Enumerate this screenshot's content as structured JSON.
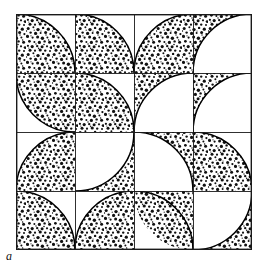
{
  "figure": {
    "label": "a",
    "caption_text": "a",
    "type": "truchet-quarter-circle-tiling",
    "frame": {
      "x": 16,
      "y": 14,
      "width": 236,
      "height": 236,
      "stroke_color": "#1a1a1a",
      "stroke_width": 1.4,
      "fill_color": "#ffffff"
    },
    "grid": {
      "columns": 4,
      "rows": 4,
      "cell_size": 59,
      "line_color": "#1a1a1a",
      "line_width": 0.9
    },
    "style": {
      "stipple_dot_color": "#111111",
      "stipple_background": "#ffffff",
      "arc_stroke_color": "#000000",
      "arc_stroke_width": 1.6,
      "page_background": "#ffffff"
    },
    "tiles": [
      {
        "col": 0,
        "row": 0,
        "corner": "tr",
        "filled_side": "outside",
        "note": "solid tile with white quarter-circle cut at top-right"
      },
      {
        "col": 1,
        "row": 0,
        "corner": "bl",
        "filled_side": "inside",
        "note": "white tile with stippled quarter-circle at bottom-left"
      },
      {
        "col": 2,
        "row": 0,
        "corner": "br",
        "filled_side": "inside",
        "note": "white tile with stippled quarter-circle at bottom-right"
      },
      {
        "col": 3,
        "row": 0,
        "corner": "br",
        "filled_side": "outside",
        "note": "solid tile with white quarter-circle cut at bottom-right"
      },
      {
        "col": 0,
        "row": 1,
        "corner": "tr",
        "filled_side": "inside",
        "note": "white tile with stippled quarter-circle at top-right"
      },
      {
        "col": 1,
        "row": 1,
        "corner": "tr",
        "filled_side": "outside",
        "note": "solid tile with white quarter-circle cut at top-right"
      },
      {
        "col": 2,
        "row": 1,
        "corner": "br",
        "filled_side": "outside",
        "note": "solid tile with white quarter-circle cut at bottom-right"
      },
      {
        "col": 3,
        "row": 1,
        "corner": "br",
        "filled_side": "outside",
        "note": "solid tile with white quarter-circle cut at bottom-right"
      },
      {
        "col": 0,
        "row": 2,
        "corner": "br",
        "filled_side": "inside",
        "note": "white tile with stippled quarter-circle at bottom-right"
      },
      {
        "col": 1,
        "row": 2,
        "corner": "tl",
        "filled_side": "outside",
        "note": "solid tile with white quarter-circle cut at top-left"
      },
      {
        "col": 2,
        "row": 2,
        "corner": "bl",
        "filled_side": "outside",
        "note": "solid tile with white quarter-circle cut at bottom-left"
      },
      {
        "col": 3,
        "row": 2,
        "corner": "bl",
        "filled_side": "inside",
        "note": "white tile with stippled quarter-circle at bottom-left"
      },
      {
        "col": 0,
        "row": 3,
        "corner": "tr",
        "filled_side": "outside",
        "note": "solid tile with white quarter-circle cut at top-right"
      },
      {
        "col": 1,
        "row": 3,
        "corner": "br",
        "filled_side": "inside",
        "note": "white tile with stippled quarter-circle at bottom-right"
      },
      {
        "col": 2,
        "row": 3,
        "corner": "tr",
        "filled_side": "inside",
        "note": "white tile with stippled quarter-circle at top-right"
      },
      {
        "col": 3,
        "row": 3,
        "corner": "tl",
        "filled_side": "outside",
        "note": "solid tile with white quarter-circle cut at top-left"
      }
    ]
  }
}
